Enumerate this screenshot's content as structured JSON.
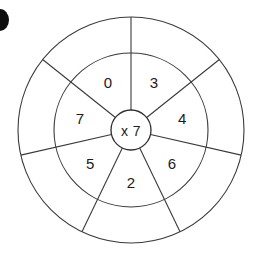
{
  "diagram": {
    "hub": {
      "label": "x 7",
      "operator": "x",
      "multiplier": "7"
    },
    "geometry": {
      "center_x": 131,
      "center_y": 130,
      "outer_radius": 113,
      "middle_radius": 77,
      "hub_radius": 20,
      "spoke_count": 7,
      "start_angle_deg": 0,
      "stroke_color": "#3a3a3a",
      "background_color": "#ffffff",
      "text_color": "#1b1b1b"
    },
    "inner_ring": {
      "name": "multiplicand-ring",
      "sectors": [
        {
          "label": "3",
          "angle_deg": 26
        },
        {
          "label": "4",
          "angle_deg": 77
        },
        {
          "label": "6",
          "angle_deg": 129
        },
        {
          "label": "2",
          "angle_deg": 180
        },
        {
          "label": "5",
          "angle_deg": 231
        },
        {
          "label": "7",
          "angle_deg": 283
        },
        {
          "label": "0",
          "angle_deg": 334
        }
      ]
    },
    "outer_ring": {
      "name": "answer-ring",
      "sectors": [
        {
          "label": "",
          "angle_deg": 26
        },
        {
          "label": "",
          "angle_deg": 77
        },
        {
          "label": "",
          "angle_deg": 129
        },
        {
          "label": "",
          "angle_deg": 180
        },
        {
          "label": "",
          "angle_deg": 231
        },
        {
          "label": "",
          "angle_deg": 283
        },
        {
          "label": "",
          "angle_deg": 334
        }
      ]
    },
    "edge_artifact": {
      "name": "page-edge-mark",
      "visible": true
    }
  }
}
